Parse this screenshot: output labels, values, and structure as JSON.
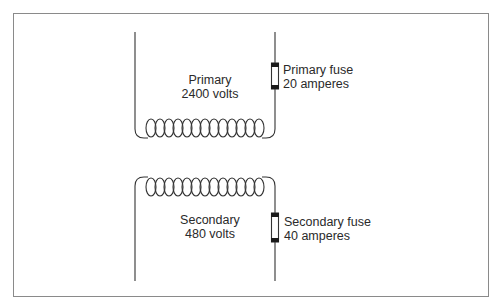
{
  "diagram": {
    "line_color": "#333333",
    "fuse_cap_color": "#1a1a1a",
    "frame_color": "#8a8a8a",
    "primary": {
      "name": "Primary",
      "voltage": "2400 volts",
      "coil_turns": 13
    },
    "primary_fuse": {
      "name": "Primary fuse",
      "rating": "20 amperes"
    },
    "secondary": {
      "name": "Secondary",
      "voltage": "480 volts",
      "coil_turns": 13
    },
    "secondary_fuse": {
      "name": "Secondary fuse",
      "rating": "40 amperes"
    }
  }
}
